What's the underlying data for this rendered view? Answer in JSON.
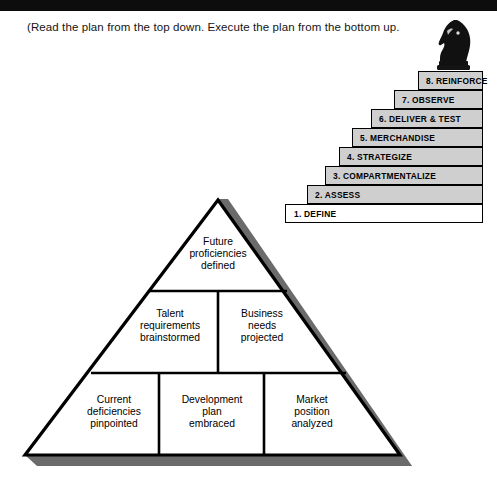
{
  "page": {
    "caption": "(Read the plan from the top down. Execute the plan from the bottom up.",
    "knight_icon": "chess-knight-icon",
    "colors": {
      "top_bar": "#0d0d0d",
      "step_fill": "#cfcfcf",
      "step_fill_first": "#ffffff",
      "outline": "#000000",
      "shadow": "#6b6b6b",
      "background": "#ffffff"
    }
  },
  "staircase": {
    "steps": [
      {
        "label": "1. DEFINE",
        "number": "1",
        "name": "DEFINE",
        "fill": "#ffffff"
      },
      {
        "label": "2. ASSESS",
        "number": "2",
        "name": "ASSESS",
        "fill": "#cfcfcf"
      },
      {
        "label": "3. COMPARTMENTALIZE",
        "number": "3",
        "name": "COMPARTMENTALIZE",
        "fill": "#cfcfcf"
      },
      {
        "label": "4. STRATEGIZE",
        "number": "4",
        "name": "STRATEGIZE",
        "fill": "#cfcfcf"
      },
      {
        "label": "5. MERCHANDISE",
        "number": "5",
        "name": "MERCHANDISE",
        "fill": "#cfcfcf"
      },
      {
        "label": "6. DELIVER & TEST",
        "number": "6",
        "name": "DELIVER & TEST",
        "fill": "#cfcfcf"
      },
      {
        "label": "7. OBSERVE",
        "number": "7",
        "name": "OBSERVE",
        "fill": "#cfcfcf"
      },
      {
        "label": "8. REINFORCE",
        "number": "8",
        "name": "REINFORCE",
        "fill": "#cfcfcf"
      }
    ]
  },
  "pyramid": {
    "tiers": [
      {
        "tier": "top",
        "cells": [
          {
            "label": "Future\nproficiencies\ndefined"
          }
        ]
      },
      {
        "tier": "middle",
        "cells": [
          {
            "label": "Talent\nrequirements\nbrainstormed"
          },
          {
            "label": "Business\nneeds\nprojected"
          }
        ]
      },
      {
        "tier": "bottom",
        "cells": [
          {
            "label": "Current\ndeficiencies\npinpointed"
          },
          {
            "label": "Development\nplan\nembraced"
          },
          {
            "label": "Market\nposition\nanalyzed"
          }
        ]
      }
    ]
  }
}
